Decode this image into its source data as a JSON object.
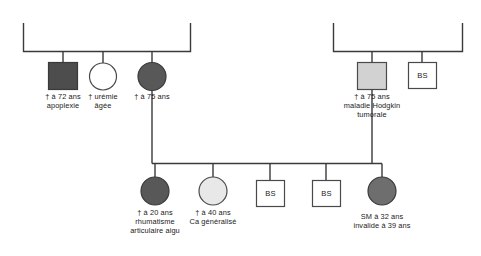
{
  "diagram": {
    "type": "pedigree-chart",
    "title": "",
    "language": "fr",
    "colors": {
      "line": "#3a3a3a",
      "stroke": "#4a4a4a",
      "text": "#1a1a1a",
      "background": "#ffffff",
      "fill_dark_square": "#4d4d4d",
      "fill_dark_circle": "#585858",
      "fill_medium_circle": "#6e6e6e",
      "fill_light_square": "#d2d2d2",
      "fill_light_circle": "#e8e8e8",
      "fill_white": "#ffffff"
    }
  },
  "generation1": {
    "left_family": {
      "sibship_line": "horizontal",
      "members": [
        {
          "id": "g1-left-male-1",
          "shape": "square",
          "sex": "male",
          "fill": "dark",
          "label_lines": [
            "† à 72 ans",
            "apoplexie"
          ]
        },
        {
          "id": "g1-left-female-1",
          "shape": "circle",
          "sex": "female",
          "fill": "white",
          "label_lines": [
            "† urémie",
            "âgée"
          ]
        },
        {
          "id": "g1-left-female-2",
          "shape": "circle",
          "sex": "female",
          "fill": "dark",
          "label_lines": [
            "† à 75 ans"
          ]
        }
      ]
    },
    "right_family": {
      "sibship_line": "horizontal",
      "members": [
        {
          "id": "g1-right-male-1",
          "shape": "square",
          "sex": "male",
          "fill": "light",
          "label_lines": [
            "† à 75 ans",
            "maladie Hodgkin",
            "tumorale"
          ]
        },
        {
          "id": "g1-right-bs-1",
          "shape": "square",
          "sex": "male",
          "fill": "white",
          "box_label": "BS",
          "label_lines": []
        }
      ]
    }
  },
  "generation2": {
    "sibship_line": "horizontal",
    "children": [
      {
        "id": "g2-child-1",
        "shape": "circle",
        "sex": "female",
        "fill": "dark",
        "label_lines": [
          "† à 20 ans",
          "rhumatisme",
          "articulaire aigu"
        ]
      },
      {
        "id": "g2-child-2",
        "shape": "circle",
        "sex": "female",
        "fill": "very-light",
        "label_lines": [
          "† à 40 ans",
          "Ca généralisé"
        ]
      },
      {
        "id": "g2-child-3",
        "shape": "square",
        "sex": "male",
        "fill": "white",
        "box_label": "BS",
        "label_lines": []
      },
      {
        "id": "g2-child-4",
        "shape": "square",
        "sex": "male",
        "fill": "white",
        "box_label": "BS",
        "label_lines": []
      },
      {
        "id": "g2-child-5",
        "shape": "circle",
        "sex": "female",
        "fill": "medium",
        "label_lines": [
          "SM à 32 ans",
          "invalide à 39 ans"
        ]
      }
    ]
  },
  "labels": {
    "l1_line1": "† à 72 ans",
    "l1_line2": "apoplexie",
    "l2_line1": "† urémie",
    "l2_line2": "âgée",
    "l3_line1": "† à 75 ans",
    "r1_line1": "† à 75 ans",
    "r1_line2": "maladie Hodgkin",
    "r1_line3": "tumorale",
    "bs_right": "BS",
    "c1_line1": "† à 20 ans",
    "c1_line2": "rhumatisme",
    "c1_line3": "articulaire aigu",
    "c2_line1": "† à 40 ans",
    "c2_line2": "Ca généralisé",
    "c3_box": "BS",
    "c4_box": "BS",
    "c5_line1": "SM à 32 ans",
    "c5_line2": "invalide à 39 ans"
  }
}
